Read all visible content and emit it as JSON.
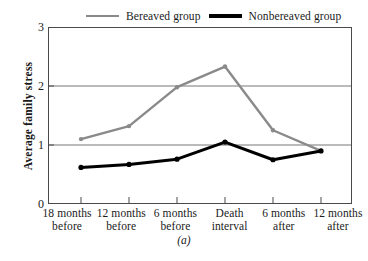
{
  "chart_data": {
    "type": "line",
    "title": "",
    "caption": "(a)",
    "xlabel": "",
    "ylabel": "Average family stress",
    "categories": [
      "18 months before",
      "12 months before",
      "6 months before",
      "Death interval",
      "6 months after",
      "12 months after"
    ],
    "category_lines": [
      [
        "18 months",
        "before"
      ],
      [
        "12 months",
        "before"
      ],
      [
        "6 months",
        "before"
      ],
      [
        "Death",
        "interval"
      ],
      [
        "6 months",
        "after"
      ],
      [
        "12 months",
        "after"
      ]
    ],
    "ylim": [
      0,
      3
    ],
    "yticks": [
      0,
      1,
      2,
      3
    ],
    "ytick_labels": [
      "0",
      "1",
      "2",
      "3"
    ],
    "grid": "horizontal",
    "legend_position": "top",
    "series": [
      {
        "name": "Bereaved group",
        "color": "#8a8a8a",
        "values": [
          1.1,
          1.32,
          1.98,
          2.33,
          1.25,
          0.9
        ]
      },
      {
        "name": "Nonbereaved group",
        "color": "#000000",
        "values": [
          0.62,
          0.67,
          0.76,
          1.05,
          0.75,
          0.9
        ]
      }
    ]
  }
}
